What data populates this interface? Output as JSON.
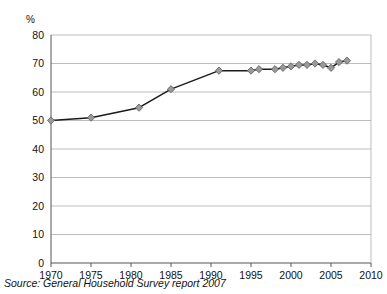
{
  "figure": {
    "ghost_text_top": "",
    "source_note": "Source: General Household Survey report 2007"
  },
  "chart_data": {
    "type": "line",
    "title": "",
    "subtitle": "",
    "xlabel": "",
    "ylabel": "%",
    "yunit_label": "%",
    "xlim": [
      1970,
      2010
    ],
    "ylim": [
      0,
      80
    ],
    "ytick_step": 10,
    "xtick_step": 5,
    "yticks": [
      0,
      10,
      20,
      30,
      40,
      50,
      60,
      70,
      80
    ],
    "ytick_labels": [
      "0",
      "10",
      "20",
      "30",
      "40",
      "50",
      "60",
      "70",
      "80"
    ],
    "xticks": [
      1970,
      1975,
      1980,
      1985,
      1990,
      1995,
      2000,
      2005,
      2010
    ],
    "xtick_labels": [
      "1970",
      "1975",
      "1980",
      "1985",
      "1990",
      "1995",
      "2000",
      "2005",
      "2010"
    ],
    "grid": "horizontal",
    "legend": "none",
    "marker": "diamond",
    "marker_color": "#9a9a9a",
    "marker_edge_color": "#5a5a5a",
    "line_color": "#1a1a1a",
    "series": [
      {
        "name": "Percentage",
        "x": [
          1970,
          1975,
          1981,
          1985,
          1991,
          1995,
          1996,
          1998,
          1999,
          2000,
          2001,
          2002,
          2003,
          2004,
          2005,
          2006,
          2007
        ],
        "values": [
          50,
          51,
          54.5,
          61,
          67.5,
          67.5,
          68,
          68,
          68.5,
          69,
          69.5,
          69.5,
          70,
          69.5,
          68.5,
          70.5,
          71
        ]
      }
    ]
  }
}
